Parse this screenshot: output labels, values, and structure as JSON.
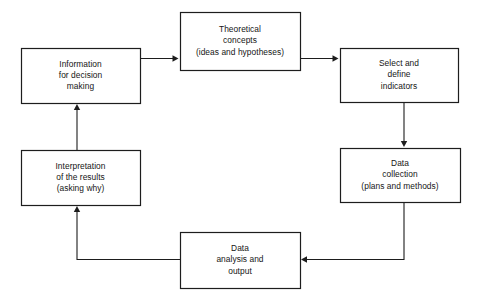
{
  "diagram": {
    "type": "flowchart",
    "title": "",
    "orientation": "clockwise-cycle",
    "background_color": "#ffffff",
    "line_color": "#1d1d1d",
    "text_color": "#151515",
    "nodes": [
      {
        "id": "information",
        "name": "information-for-decision-making",
        "lines": [
          "Information",
          "for decision",
          "making"
        ],
        "x": 21,
        "y": 48,
        "w": 119,
        "h": 55
      },
      {
        "id": "theoretical",
        "name": "theoretical-concepts",
        "lines": [
          "Theoretical",
          "concepts",
          "(ideas and hypotheses)"
        ],
        "x": 180,
        "y": 12,
        "w": 120,
        "h": 58
      },
      {
        "id": "indicators",
        "name": "select-and-define-indicators",
        "lines": [
          "Select and",
          "define",
          "indicators"
        ],
        "x": 340,
        "y": 48,
        "w": 118,
        "h": 54
      },
      {
        "id": "collection",
        "name": "data-collection",
        "lines": [
          "Data",
          "collection",
          "(plans and methods)"
        ],
        "x": 340,
        "y": 148,
        "w": 120,
        "h": 54
      },
      {
        "id": "analysis",
        "name": "data-analysis-and-output",
        "lines": [
          "Data",
          "analysis and",
          "output"
        ],
        "x": 180,
        "y": 232,
        "w": 120,
        "h": 56
      },
      {
        "id": "interpretation",
        "name": "interpretation-of-the-results",
        "lines": [
          "Interpretation",
          "of the results",
          "(asking why)"
        ],
        "x": 21,
        "y": 150,
        "w": 119,
        "h": 55
      }
    ],
    "edges": [
      {
        "id": "e1",
        "name": "arrow-information-to-theoretical",
        "from": "information",
        "to": "theoretical",
        "direction": "right",
        "path": "M 140 58.5 L 177 58.5",
        "head": "178.5,58.5 172.5,55.3 172.5,61.7"
      },
      {
        "id": "e2",
        "name": "arrow-theoretical-to-indicators",
        "from": "theoretical",
        "to": "indicators",
        "direction": "right",
        "path": "M 300 58.5 L 337 58.5",
        "head": "338.5,58.5 332.5,55.3 332.5,61.7"
      },
      {
        "id": "e3",
        "name": "arrow-indicators-to-collection",
        "from": "indicators",
        "to": "collection",
        "direction": "down",
        "path": "M 404 102 L 404 145",
        "head": "404,147 400.8,141 407.2,141"
      },
      {
        "id": "e4",
        "name": "arrow-collection-to-analysis",
        "from": "collection",
        "to": "analysis",
        "direction": "left",
        "path": "M 404 202 L 404 259.5 L 303 259.5",
        "head": "301,259.5 307,256.3 307,262.7"
      },
      {
        "id": "e5",
        "name": "arrow-analysis-to-interpretation",
        "from": "analysis",
        "to": "interpretation",
        "direction": "up",
        "path": "M 180 259.5 L 77 259.5 L 77 208",
        "head": "77,206 73.8,212 80.2,212"
      },
      {
        "id": "e6",
        "name": "arrow-interpretation-to-information",
        "from": "interpretation",
        "to": "information",
        "direction": "up",
        "path": "M 77 150 L 77 106",
        "head": "77,104 73.8,110 80.2,110"
      }
    ]
  }
}
